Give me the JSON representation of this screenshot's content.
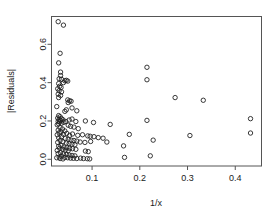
{
  "chart_data": {
    "type": "scatter",
    "title": "",
    "xlabel": "1/x",
    "ylabel": "|Residuals|",
    "xlim": [
      0.015,
      0.455
    ],
    "ylim": [
      -0.035,
      0.745
    ],
    "xticks": [
      0.1,
      0.2,
      0.3,
      0.4
    ],
    "xtick_labels": [
      "0.1",
      "0.2",
      "0.3",
      "0.4"
    ],
    "yticks": [
      0.0,
      0.2,
      0.4,
      0.6
    ],
    "ytick_labels": [
      "0.0",
      "0.2",
      "0.4",
      "0.6"
    ],
    "grid": false,
    "legend": null,
    "marker": "open-circle",
    "marker_color": "#222222",
    "points": [
      [
        0.029,
        0.718
      ],
      [
        0.04,
        0.7
      ],
      [
        0.033,
        0.553
      ],
      [
        0.03,
        0.503
      ],
      [
        0.034,
        0.455
      ],
      [
        0.034,
        0.437
      ],
      [
        0.031,
        0.42
      ],
      [
        0.036,
        0.417
      ],
      [
        0.043,
        0.41
      ],
      [
        0.046,
        0.412
      ],
      [
        0.049,
        0.408
      ],
      [
        0.04,
        0.4
      ],
      [
        0.03,
        0.395
      ],
      [
        0.032,
        0.381
      ],
      [
        0.035,
        0.375
      ],
      [
        0.028,
        0.368
      ],
      [
        0.031,
        0.358
      ],
      [
        0.036,
        0.352
      ],
      [
        0.029,
        0.34
      ],
      [
        0.034,
        0.333
      ],
      [
        0.03,
        0.322
      ],
      [
        0.049,
        0.31
      ],
      [
        0.053,
        0.305
      ],
      [
        0.056,
        0.303
      ],
      [
        0.05,
        0.296
      ],
      [
        0.026,
        0.275
      ],
      [
        0.058,
        0.268
      ],
      [
        0.046,
        0.258
      ],
      [
        0.068,
        0.253
      ],
      [
        0.043,
        0.25
      ],
      [
        0.03,
        0.228
      ],
      [
        0.033,
        0.222
      ],
      [
        0.028,
        0.215
      ],
      [
        0.036,
        0.212
      ],
      [
        0.031,
        0.208
      ],
      [
        0.039,
        0.206
      ],
      [
        0.034,
        0.202
      ],
      [
        0.029,
        0.198
      ],
      [
        0.032,
        0.195
      ],
      [
        0.041,
        0.193
      ],
      [
        0.036,
        0.188
      ],
      [
        0.03,
        0.185
      ],
      [
        0.027,
        0.18
      ],
      [
        0.045,
        0.197
      ],
      [
        0.052,
        0.205
      ],
      [
        0.058,
        0.21
      ],
      [
        0.066,
        0.197
      ],
      [
        0.086,
        0.2
      ],
      [
        0.103,
        0.192
      ],
      [
        0.138,
        0.182
      ],
      [
        0.215,
        0.203
      ],
      [
        0.05,
        0.178
      ],
      [
        0.055,
        0.172
      ],
      [
        0.062,
        0.168
      ],
      [
        0.071,
        0.16
      ],
      [
        0.033,
        0.165
      ],
      [
        0.038,
        0.158
      ],
      [
        0.029,
        0.152
      ],
      [
        0.043,
        0.148
      ],
      [
        0.035,
        0.143
      ],
      [
        0.031,
        0.138
      ],
      [
        0.047,
        0.135
      ],
      [
        0.04,
        0.13
      ],
      [
        0.027,
        0.128
      ],
      [
        0.053,
        0.125
      ],
      [
        0.059,
        0.132
      ],
      [
        0.07,
        0.125
      ],
      [
        0.08,
        0.128
      ],
      [
        0.091,
        0.122
      ],
      [
        0.096,
        0.12
      ],
      [
        0.104,
        0.118
      ],
      [
        0.113,
        0.113
      ],
      [
        0.123,
        0.11
      ],
      [
        0.178,
        0.13
      ],
      [
        0.228,
        0.1
      ],
      [
        0.305,
        0.124
      ],
      [
        0.432,
        0.137
      ],
      [
        0.036,
        0.118
      ],
      [
        0.03,
        0.112
      ],
      [
        0.044,
        0.108
      ],
      [
        0.05,
        0.105
      ],
      [
        0.056,
        0.1
      ],
      [
        0.062,
        0.098
      ],
      [
        0.068,
        0.095
      ],
      [
        0.033,
        0.098
      ],
      [
        0.039,
        0.092
      ],
      [
        0.028,
        0.088
      ],
      [
        0.046,
        0.085
      ],
      [
        0.052,
        0.082
      ],
      [
        0.058,
        0.079
      ],
      [
        0.064,
        0.076
      ],
      [
        0.075,
        0.09
      ],
      [
        0.085,
        0.088
      ],
      [
        0.097,
        0.093
      ],
      [
        0.131,
        0.09
      ],
      [
        0.166,
        0.07
      ],
      [
        0.035,
        0.072
      ],
      [
        0.03,
        0.068
      ],
      [
        0.041,
        0.064
      ],
      [
        0.047,
        0.06
      ],
      [
        0.053,
        0.057
      ],
      [
        0.059,
        0.055
      ],
      [
        0.066,
        0.052
      ],
      [
        0.032,
        0.058
      ],
      [
        0.038,
        0.052
      ],
      [
        0.044,
        0.048
      ],
      [
        0.05,
        0.045
      ],
      [
        0.027,
        0.046
      ],
      [
        0.086,
        0.043
      ],
      [
        0.092,
        0.04
      ],
      [
        0.034,
        0.035
      ],
      [
        0.029,
        0.03
      ],
      [
        0.04,
        0.028
      ],
      [
        0.046,
        0.025
      ],
      [
        0.052,
        0.022
      ],
      [
        0.058,
        0.02
      ],
      [
        0.064,
        0.018
      ],
      [
        0.036,
        0.016
      ],
      [
        0.031,
        0.012
      ],
      [
        0.043,
        0.01
      ],
      [
        0.049,
        0.008
      ],
      [
        0.055,
        0.006
      ],
      [
        0.061,
        0.005
      ],
      [
        0.068,
        0.004
      ],
      [
        0.076,
        0.006
      ],
      [
        0.082,
        0.004
      ],
      [
        0.09,
        0.003
      ],
      [
        0.095,
        0.002
      ],
      [
        0.026,
        0.008
      ],
      [
        0.033,
        0.004
      ],
      [
        0.039,
        0.002
      ],
      [
        0.215,
        0.48
      ],
      [
        0.215,
        0.415
      ],
      [
        0.274,
        0.322
      ],
      [
        0.333,
        0.308
      ],
      [
        0.432,
        0.212
      ],
      [
        0.222,
        0.018
      ],
      [
        0.168,
        0.01
      ]
    ]
  },
  "axes": {
    "xlabel": "1/x",
    "ylabel": "|Residuals|"
  }
}
